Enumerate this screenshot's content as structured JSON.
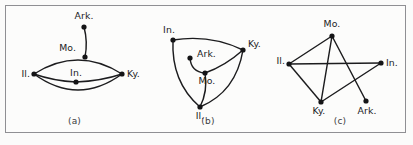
{
  "figure": {
    "width": 413,
    "height": 145,
    "background_color": "#fbfbfa",
    "frame_color": "#8f8f93",
    "edge_color": "#1c1c1e",
    "node_color": "#141416",
    "label_color": "#1b1b1d"
  },
  "panels": [
    {
      "id": "a",
      "caption": "(a)",
      "description": "Multigraph with two parallel Il.-Ky. curves; Mo. lies on the upper curve with a pendant edge to Ark.; In. lies on the middle Il.-Ky. path.",
      "nodes": [
        {
          "key": "ark",
          "label": "Ark.",
          "x": 78,
          "y": 21,
          "label_x": 78,
          "label_y": 13,
          "label_anchor": "middle"
        },
        {
          "key": "mo",
          "label": "Mo.",
          "x": 79,
          "y": 51,
          "label_x": 70,
          "label_y": 45,
          "label_anchor": "end"
        },
        {
          "key": "il",
          "label": "Il.",
          "x": 28,
          "y": 68,
          "label_x": 24,
          "label_y": 71,
          "label_anchor": "end"
        },
        {
          "key": "in",
          "label": "In.",
          "x": 70,
          "y": 76,
          "label_x": 70,
          "label_y": 70,
          "label_anchor": "middle"
        },
        {
          "key": "ky",
          "label": "Ky.",
          "x": 116,
          "y": 68,
          "label_x": 121,
          "label_y": 71,
          "label_anchor": "start"
        }
      ],
      "edges": [
        {
          "from": "ark",
          "to": "mo",
          "type": "curve",
          "path": "M 78 21 Q 82 36 79 51"
        },
        {
          "from": "il",
          "to": "ky",
          "type": "curve",
          "path": "M 28 68 Q 72 40 116 68",
          "note": "upper arc through Mo."
        },
        {
          "from": "il",
          "to": "in",
          "type": "curve",
          "path": "M 28 68 Q 48 75 70 76"
        },
        {
          "from": "in",
          "to": "ky",
          "type": "curve",
          "path": "M 70 76 Q 95 75 116 68"
        },
        {
          "from": "il",
          "to": "ky",
          "type": "curve",
          "path": "M 28 68 Q 72 100 116 68",
          "note": "lower arc"
        }
      ]
    },
    {
      "id": "b",
      "caption": "(b)",
      "description": "Triangle of curved edges In.-Ky., In.-Il., Il.-Ky.; Mo. is an interior hub joined to In.-Ky. arc, Il. and Ark.",
      "nodes": [
        {
          "key": "in",
          "label": "In.",
          "x": 30,
          "y": 34,
          "label_x": 26,
          "label_y": 27,
          "label_anchor": "middle"
        },
        {
          "key": "ky",
          "label": "Ky.",
          "x": 100,
          "y": 44,
          "label_x": 105,
          "label_y": 41,
          "label_anchor": "start"
        },
        {
          "key": "ark",
          "label": "Ark.",
          "x": 47,
          "y": 52,
          "label_x": 54,
          "label_y": 51,
          "label_anchor": "start"
        },
        {
          "key": "mo",
          "label": "Mo.",
          "x": 62,
          "y": 67,
          "label_x": 64,
          "label_y": 78,
          "label_anchor": "middle"
        },
        {
          "key": "il",
          "label": "Il.",
          "x": 57,
          "y": 101,
          "label_x": 57,
          "label_y": 113,
          "label_anchor": "middle"
        }
      ],
      "edges": [
        {
          "from": "in",
          "to": "ky",
          "type": "curve",
          "path": "M 30 34 Q 67 28 100 44"
        },
        {
          "from": "in",
          "to": "il",
          "type": "curve",
          "path": "M 30 34 Q 28 76 57 101"
        },
        {
          "from": "il",
          "to": "ky",
          "type": "curve",
          "path": "M 57 101 Q 93 86 100 44"
        },
        {
          "from": "mo",
          "to": "ky",
          "type": "curve",
          "path": "M 62 67 Q 82 60 100 44"
        },
        {
          "from": "mo",
          "to": "il",
          "type": "curve",
          "path": "M 62 67 Q 65 85 57 101"
        },
        {
          "from": "mo",
          "to": "ark",
          "type": "curve",
          "path": "M 62 67 Q 48 66 47 52"
        }
      ]
    },
    {
      "id": "c",
      "caption": "(c)",
      "description": "Straight-edge drawing with crossings: Il.-Mo., Il.-In., Il.-Ky., Mo.-Ky., Mo.-Ark., Ky.-In.",
      "nodes": [
        {
          "key": "mo",
          "label": "Mo.",
          "x": 59,
          "y": 30,
          "label_x": 59,
          "label_y": 21,
          "label_anchor": "middle"
        },
        {
          "key": "il",
          "label": "Il.",
          "x": 16,
          "y": 58,
          "label_x": 12,
          "label_y": 58,
          "label_anchor": "end"
        },
        {
          "key": "in",
          "label": "In.",
          "x": 108,
          "y": 57,
          "label_x": 113,
          "label_y": 60,
          "label_anchor": "start"
        },
        {
          "key": "ky",
          "label": "Ky.",
          "x": 48,
          "y": 96,
          "label_x": 46,
          "label_y": 108,
          "label_anchor": "middle"
        },
        {
          "key": "ark",
          "label": "Ark.",
          "x": 93,
          "y": 95,
          "label_x": 94,
          "label_y": 108,
          "label_anchor": "middle"
        }
      ],
      "edges": [
        {
          "from": "il",
          "to": "mo",
          "type": "line"
        },
        {
          "from": "il",
          "to": "in",
          "type": "line"
        },
        {
          "from": "il",
          "to": "ky",
          "type": "line"
        },
        {
          "from": "mo",
          "to": "ky",
          "type": "line"
        },
        {
          "from": "mo",
          "to": "ark",
          "type": "line"
        },
        {
          "from": "ky",
          "to": "in",
          "type": "line"
        }
      ]
    }
  ]
}
